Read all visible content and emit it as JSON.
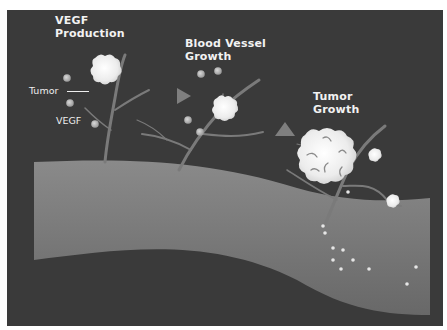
{
  "diagram": {
    "colors": {
      "background": "#3a3a3a",
      "vessel_top": "#8a8a8a",
      "vessel_bottom": "#6a6a6a",
      "branch": "#7a7a7a",
      "tumor": "#f4f4f4",
      "vegf_dot": "#bdbdbd",
      "arrow": "#8c8c8c",
      "text": "#f2f2f2"
    },
    "stages": [
      {
        "id": "vegf-production",
        "label": "VEGF\nProduction"
      },
      {
        "id": "blood-vessel-growth",
        "label": "Blood Vessel\nGrowth"
      },
      {
        "id": "tumor-growth",
        "label": "Tumor\nGrowth"
      }
    ],
    "callouts": {
      "tumor": "Tumor",
      "vegf": "VEGF"
    }
  }
}
